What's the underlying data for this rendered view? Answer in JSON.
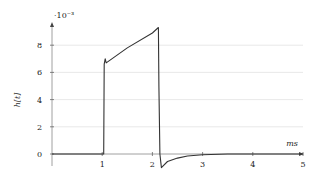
{
  "chart_data": {
    "type": "line",
    "title": "",
    "xlabel": "ms",
    "ylabel": "h[t]",
    "y_scale_label": "·10⁻³",
    "xlim": [
      0,
      5
    ],
    "ylim": [
      -1.2,
      9.6
    ],
    "x_ticks": [
      1,
      2,
      3,
      4,
      5
    ],
    "y_ticks": [
      0,
      2,
      4,
      6,
      8
    ],
    "grid": "horizontal",
    "legend": null,
    "series": [
      {
        "name": "h[t]",
        "color": "#333333",
        "x": [
          0,
          1.0,
          1.03,
          1.04,
          1.06,
          1.08,
          1.5,
          2.0,
          2.12,
          2.13,
          2.15,
          2.18,
          2.3,
          2.5,
          2.7,
          3.0,
          3.5,
          4.0,
          5.0
        ],
        "y": [
          0,
          0,
          0,
          6.6,
          7.0,
          6.7,
          7.8,
          8.9,
          9.3,
          5.0,
          0,
          -1.0,
          -0.55,
          -0.3,
          -0.15,
          -0.05,
          0,
          0,
          0
        ]
      }
    ]
  }
}
